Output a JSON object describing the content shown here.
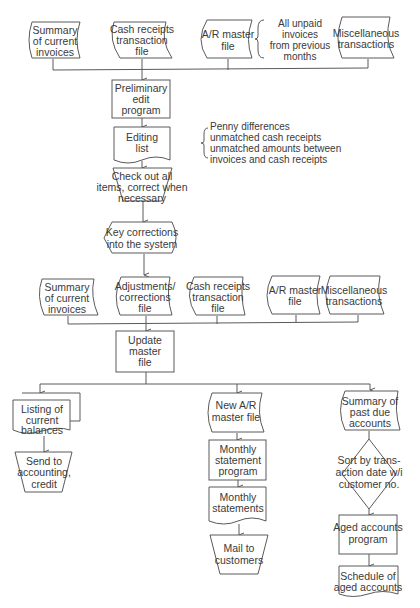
{
  "diagram": {
    "type": "flowchart",
    "colors": {
      "stroke": "#5a5a5a",
      "text": "#3a3a3a",
      "background": "#ffffff"
    },
    "inputs_stage1": [
      {
        "id": "summary-current-invoices-1",
        "shape": "online-storage",
        "lines": [
          "Summary",
          "of current",
          "invoices"
        ]
      },
      {
        "id": "cash-receipts-file-1",
        "shape": "online-storage",
        "lines": [
          "Cash receipts",
          "transaction",
          "file"
        ]
      },
      {
        "id": "ar-master-file-1",
        "shape": "online-storage",
        "lines": [
          "A/R master",
          "file"
        ]
      },
      {
        "id": "miscellaneous-transactions-1",
        "shape": "online-storage",
        "lines": [
          "Miscellaneous",
          "transactions"
        ]
      }
    ],
    "ar_note": {
      "lines": [
        "All unpaid",
        "invoices",
        "from previous",
        "months"
      ]
    },
    "preliminary_edit": {
      "shape": "process",
      "lines": [
        "Preliminary",
        "edit",
        "program"
      ]
    },
    "editing_list": {
      "shape": "document",
      "lines": [
        "Editing",
        "list"
      ]
    },
    "editing_note": {
      "lines": [
        "Penny differences",
        "unmatched cash receipts",
        "unmatched amounts between",
        "invoices and cash receipts"
      ]
    },
    "check_out": {
      "shape": "manual-operation",
      "lines": [
        "Check out all",
        "items, correct when",
        "necessary"
      ]
    },
    "key_corrections": {
      "shape": "display",
      "lines": [
        "Key corrections",
        "into the system"
      ]
    },
    "inputs_stage2": [
      {
        "id": "summary-current-invoices-2",
        "shape": "online-storage",
        "lines": [
          "Summary",
          "of current",
          "invoices"
        ]
      },
      {
        "id": "adjustments-corrections-file",
        "shape": "online-storage",
        "lines": [
          "Adjustments/",
          "corrections",
          "file"
        ]
      },
      {
        "id": "cash-receipts-file-2",
        "shape": "online-storage",
        "lines": [
          "Cash receipts",
          "transaction",
          "file"
        ]
      },
      {
        "id": "ar-master-file-2",
        "shape": "online-storage",
        "lines": [
          "A/R master",
          "file"
        ]
      },
      {
        "id": "miscellaneous-transactions-2",
        "shape": "online-storage",
        "lines": [
          "Miscellaneous",
          "transactions"
        ]
      }
    ],
    "update_master": {
      "shape": "process",
      "lines": [
        "Update",
        "master",
        "file"
      ]
    },
    "branch_left": {
      "listing": {
        "shape": "multi-document",
        "lines": [
          "Listing of",
          "current",
          "balances"
        ]
      },
      "send": {
        "shape": "manual-operation",
        "lines": [
          "Send to",
          "accounting,",
          "credit"
        ]
      }
    },
    "branch_middle": {
      "new_master": {
        "shape": "online-storage",
        "lines": [
          "New A/R",
          "master file"
        ]
      },
      "statement_program": {
        "shape": "process",
        "lines": [
          "Monthly",
          "statement",
          "program"
        ]
      },
      "statements": {
        "shape": "document",
        "lines": [
          "Monthly",
          "statements"
        ]
      },
      "mail": {
        "shape": "manual-operation",
        "lines": [
          "Mail to",
          "customers"
        ]
      }
    },
    "branch_right": {
      "past_due": {
        "shape": "online-storage",
        "lines": [
          "Summary of",
          "past due",
          "accounts"
        ]
      },
      "sort": {
        "shape": "decision",
        "lines": [
          "Sort by trans-",
          "action date w/i",
          "customer no."
        ]
      },
      "aged_program": {
        "shape": "process",
        "lines": [
          "Aged accounts",
          "program"
        ]
      },
      "schedule": {
        "shape": "document",
        "lines": [
          "Schedule of",
          "aged accounts"
        ]
      }
    }
  }
}
